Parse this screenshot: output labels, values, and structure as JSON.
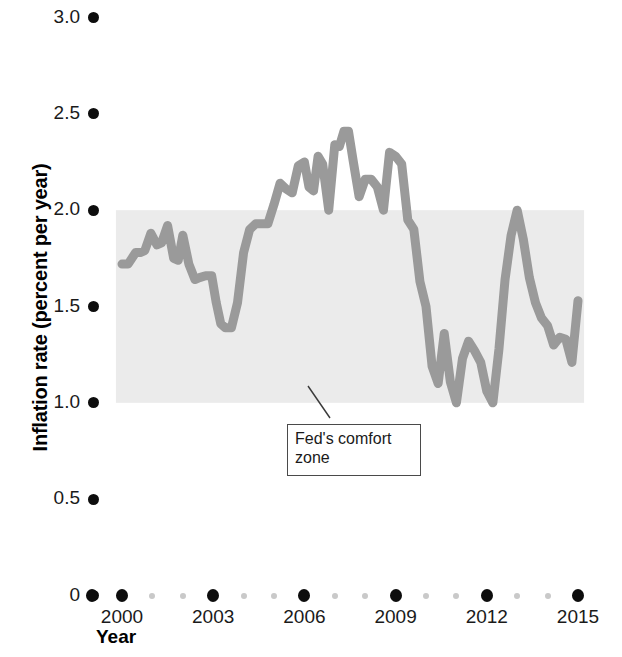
{
  "chart_data": {
    "type": "line",
    "title": "",
    "xlabel": "Year",
    "ylabel": "Inflation rate (percent per year)",
    "xlim": [
      1999.5,
      2015.3
    ],
    "ylim": [
      0,
      3.0
    ],
    "grid": false,
    "legend": null,
    "line_color": "#9a9a9a",
    "band_color": "#ebebeb",
    "y_ticks": [
      "0",
      "0.5",
      "1.0",
      "1.5",
      "2.0",
      "2.5",
      "3.0"
    ],
    "y_tick_values": [
      0,
      0.5,
      1.0,
      1.5,
      2.0,
      2.5,
      3.0
    ],
    "x_ticks": [
      "2000",
      "2003",
      "2006",
      "2009",
      "2012",
      "2015"
    ],
    "x_tick_values": [
      2000,
      2003,
      2006,
      2009,
      2012,
      2015
    ],
    "x_minor_tick_values": [
      2001,
      2002,
      2004,
      2005,
      2007,
      2008,
      2010,
      2011,
      2013,
      2014
    ],
    "annotations": [
      {
        "text_line1": "Fed's comfort",
        "text_line2": "zone",
        "label": "Fed's comfort zone",
        "band_low": 1.0,
        "band_high": 2.0,
        "band_x_start": 1999.8,
        "band_x_end": 2015.2
      }
    ],
    "series": [
      {
        "name": "Core inflation rate",
        "x": [
          2000.0,
          2000.2,
          2000.45,
          2000.6,
          2000.75,
          2000.95,
          2001.15,
          2001.3,
          2001.5,
          2001.7,
          2001.85,
          2002.0,
          2002.2,
          2002.4,
          2002.55,
          2002.75,
          2002.95,
          2003.1,
          2003.25,
          2003.4,
          2003.6,
          2003.8,
          2004.0,
          2004.2,
          2004.4,
          2004.6,
          2004.8,
          2005.0,
          2005.2,
          2005.4,
          2005.6,
          2005.8,
          2006.0,
          2006.15,
          2006.3,
          2006.45,
          2006.6,
          2006.8,
          2007.0,
          2007.15,
          2007.3,
          2007.45,
          2007.6,
          2007.8,
          2008.0,
          2008.2,
          2008.4,
          2008.6,
          2008.8,
          2009.0,
          2009.2,
          2009.4,
          2009.6,
          2009.8,
          2010.0,
          2010.2,
          2010.4,
          2010.6,
          2010.8,
          2011.0,
          2011.2,
          2011.4,
          2011.6,
          2011.8,
          2012.0,
          2012.2,
          2012.4,
          2012.6,
          2012.8,
          2013.0,
          2013.2,
          2013.4,
          2013.6,
          2013.8,
          2014.0,
          2014.2,
          2014.4,
          2014.6,
          2014.8,
          2015.0
        ],
        "y": [
          1.72,
          1.72,
          1.78,
          1.78,
          1.79,
          1.88,
          1.82,
          1.83,
          1.92,
          1.75,
          1.74,
          1.87,
          1.72,
          1.64,
          1.65,
          1.66,
          1.66,
          1.52,
          1.41,
          1.39,
          1.39,
          1.52,
          1.78,
          1.9,
          1.93,
          1.93,
          1.93,
          2.03,
          2.14,
          2.11,
          2.09,
          2.23,
          2.25,
          2.12,
          2.1,
          2.28,
          2.24,
          2.0,
          2.34,
          2.33,
          2.41,
          2.41,
          2.26,
          2.07,
          2.16,
          2.16,
          2.12,
          2.0,
          2.3,
          2.28,
          2.24,
          1.95,
          1.9,
          1.63,
          1.5,
          1.19,
          1.1,
          1.36,
          1.11,
          1.0,
          1.23,
          1.32,
          1.27,
          1.21,
          1.06,
          1.0,
          1.28,
          1.64,
          1.87,
          2.0,
          1.85,
          1.65,
          1.52,
          1.44,
          1.4,
          1.3,
          1.34,
          1.33,
          1.21,
          1.53
        ]
      }
    ]
  },
  "axes": {
    "y_title": "Inflation rate (percent per year)",
    "x_title": "Year"
  }
}
